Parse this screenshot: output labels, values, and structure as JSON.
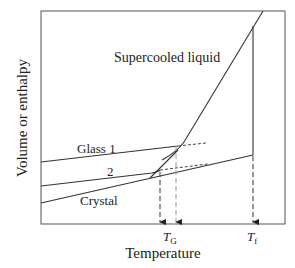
{
  "diagram": {
    "title": "",
    "x_axis_label": "Temperature",
    "y_axis_label": "Volume or enthalpy",
    "curve_labels": {
      "liquid": "Supercooled liquid",
      "glass1": "Glass 1",
      "glass2": "2",
      "crystal": "Crystal"
    },
    "tick_labels": {
      "tg_main": "T",
      "tg_sub": "G",
      "tf_main": "T",
      "tf_sub": "f"
    },
    "colors": {
      "line": "#333333",
      "dashed": "#444444",
      "light_dashed": "#999999",
      "background": "#ffffff"
    }
  }
}
